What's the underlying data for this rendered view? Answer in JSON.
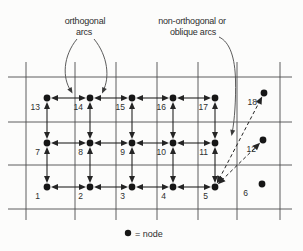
{
  "figure": {
    "annotations": {
      "orthogonal": {
        "line1": "orthogonal",
        "line2": "arcs"
      },
      "oblique": {
        "line1": "non-orthogonal or",
        "line2": "oblique arcs"
      }
    },
    "legend": {
      "symbol": "node-dot",
      "text": "= node"
    },
    "colors": {
      "background": "#fcfcfb",
      "grid": "#4c4c4c",
      "arc": "#242424",
      "node": "#161616",
      "text": "#2e2e2e"
    },
    "grid": {
      "vertical_x": [
        26,
        75,
        116,
        157,
        198,
        237,
        280
      ],
      "vertical_span": [
        62,
        220
      ],
      "horizontal_y": [
        77,
        122,
        165,
        209
      ],
      "horizontal_span": [
        8,
        292
      ]
    },
    "nodes": [
      {
        "id": "1",
        "x": 47,
        "y": 187
      },
      {
        "id": "2",
        "x": 90,
        "y": 187
      },
      {
        "id": "3",
        "x": 132,
        "y": 187
      },
      {
        "id": "4",
        "x": 173,
        "y": 187
      },
      {
        "id": "5",
        "x": 215,
        "y": 187
      },
      {
        "id": "6",
        "x": 262,
        "y": 184,
        "ldx": -14
      },
      {
        "id": "7",
        "x": 47,
        "y": 143
      },
      {
        "id": "8",
        "x": 90,
        "y": 143
      },
      {
        "id": "9",
        "x": 132,
        "y": 143
      },
      {
        "id": "10",
        "x": 173,
        "y": 143
      },
      {
        "id": "11",
        "x": 215,
        "y": 143
      },
      {
        "id": "12",
        "x": 263,
        "y": 140
      },
      {
        "id": "13",
        "x": 47,
        "y": 98
      },
      {
        "id": "14",
        "x": 90,
        "y": 98
      },
      {
        "id": "15",
        "x": 132,
        "y": 98
      },
      {
        "id": "16",
        "x": 173,
        "y": 98
      },
      {
        "id": "17",
        "x": 215,
        "y": 98
      },
      {
        "id": "18",
        "x": 264,
        "y": 93
      }
    ],
    "orthogonal_arcs": [
      [
        "13",
        "14"
      ],
      [
        "14",
        "15"
      ],
      [
        "15",
        "16"
      ],
      [
        "16",
        "17"
      ],
      [
        "7",
        "8"
      ],
      [
        "8",
        "9"
      ],
      [
        "9",
        "10"
      ],
      [
        "10",
        "11"
      ],
      [
        "1",
        "2"
      ],
      [
        "2",
        "3"
      ],
      [
        "3",
        "4"
      ],
      [
        "4",
        "5"
      ],
      [
        "13",
        "7"
      ],
      [
        "14",
        "8"
      ],
      [
        "15",
        "9"
      ],
      [
        "16",
        "10"
      ],
      [
        "17",
        "11"
      ],
      [
        "7",
        "1"
      ],
      [
        "8",
        "2"
      ],
      [
        "9",
        "3"
      ],
      [
        "10",
        "4"
      ],
      [
        "11",
        "5"
      ]
    ],
    "oblique_arcs": [
      [
        "5",
        "12"
      ],
      [
        "5",
        "18"
      ]
    ]
  }
}
